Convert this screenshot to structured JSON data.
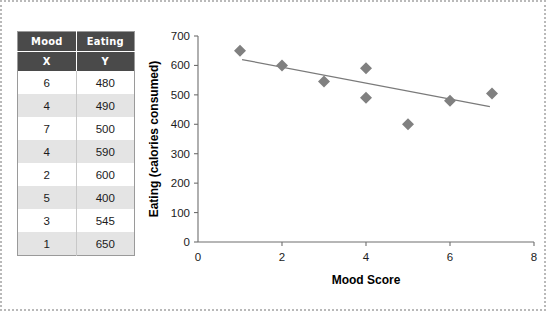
{
  "table": {
    "header_groups": [
      "Mood",
      "Eating"
    ],
    "header_vars": [
      "X",
      "Y"
    ],
    "rows": [
      {
        "mood": "6",
        "eating": "480"
      },
      {
        "mood": "4",
        "eating": "490"
      },
      {
        "mood": "7",
        "eating": "500"
      },
      {
        "mood": "4",
        "eating": "590"
      },
      {
        "mood": "2",
        "eating": "600"
      },
      {
        "mood": "5",
        "eating": "400"
      },
      {
        "mood": "3",
        "eating": "545"
      },
      {
        "mood": "1",
        "eating": "650"
      }
    ]
  },
  "chart_data": {
    "type": "scatter",
    "title": "",
    "xlabel": "Mood Score",
    "ylabel": "Eating (calories consumed)",
    "xlim": [
      0,
      8
    ],
    "ylim": [
      0,
      700
    ],
    "xticks": [
      0,
      2,
      4,
      6,
      8
    ],
    "xtick_labels": [
      "0",
      "2",
      "4",
      "6",
      "8"
    ],
    "yticks": [
      0,
      100,
      200,
      300,
      400,
      500,
      600,
      700
    ],
    "ytick_labels": [
      "0",
      "100",
      "200",
      "300",
      "400",
      "500",
      "600",
      "700"
    ],
    "grid": false,
    "legend": false,
    "marker": "diamond",
    "marker_color": "#808080",
    "points": [
      {
        "x": 1,
        "y": 650
      },
      {
        "x": 2,
        "y": 600
      },
      {
        "x": 3,
        "y": 545
      },
      {
        "x": 4,
        "y": 590
      },
      {
        "x": 4,
        "y": 490
      },
      {
        "x": 5,
        "y": 400
      },
      {
        "x": 6,
        "y": 480
      },
      {
        "x": 7,
        "y": 505
      }
    ],
    "trendline": {
      "color": "#7a7a7a",
      "x_start": 1.05,
      "y_start": 620,
      "x_end": 6.95,
      "y_end": 460
    }
  }
}
